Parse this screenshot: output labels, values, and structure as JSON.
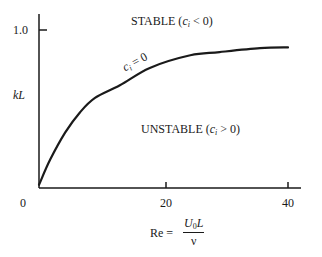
{
  "chart_data": {
    "type": "line",
    "title": "",
    "xlabel": "Re = U0L / ν",
    "ylabel": "kL",
    "xlim": [
      0,
      42
    ],
    "ylim": [
      0,
      1.1
    ],
    "x_ticks": [
      {
        "value": 0,
        "label": "0"
      },
      {
        "value": 20,
        "label": "20"
      },
      {
        "value": 40,
        "label": "40"
      }
    ],
    "y_ticks": [
      {
        "value": 1.0,
        "label": "1.0"
      }
    ],
    "grid": false,
    "legend": null,
    "series": [
      {
        "name": "c_i = 0 (neutral stability curve)",
        "x": [
          0,
          1.8,
          4.2,
          6.6,
          9,
          13,
          17.8,
          24.3,
          29,
          35.5,
          40
        ],
        "y": [
          0.02,
          0.18,
          0.35,
          0.48,
          0.57,
          0.65,
          0.76,
          0.84,
          0.86,
          0.885,
          0.89
        ]
      }
    ],
    "annotations": [
      {
        "text": "STABLE (c_i < 0)",
        "region": "above curve"
      },
      {
        "text": "UNSTABLE (c_i > 0)",
        "region": "below curve"
      },
      {
        "text": "c_i = 0",
        "position": "on curve near Re≈15"
      }
    ]
  },
  "labels": {
    "y_tick_1": "1.0",
    "y_axis": "kL",
    "origin": "0",
    "x_tick_20": "20",
    "x_tick_40": "40",
    "stable_word": "STABLE (",
    "stable_c": "c",
    "stable_sub": "i",
    "stable_rest": " < 0)",
    "unstable_word": "UNSTABLE (",
    "unstable_c": "c",
    "unstable_sub": "i",
    "unstable_rest": " > 0)",
    "curve_c": "c",
    "curve_sub": "i",
    "curve_rest": " = 0",
    "re_label": "Re =",
    "re_num_u": "U",
    "re_num_sub": "0",
    "re_num_l": "L",
    "re_den": "ν"
  },
  "style": {
    "line_color": "#1a1a1a",
    "background": "#ffffff"
  }
}
